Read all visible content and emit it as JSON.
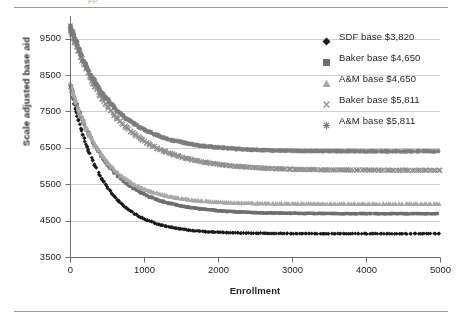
{
  "figure": {
    "clipped_caption": "pp",
    "background": "#ffffff"
  },
  "chart_data": {
    "type": "scatter",
    "title": "",
    "xlabel": "Enrollment",
    "ylabel": "Scale adjusted base aid",
    "xlim": [
      0,
      5000
    ],
    "ylim": [
      3500,
      9500
    ],
    "y_axis_overflow_top": 9900,
    "xticks": [
      0,
      1000,
      2000,
      3000,
      4000,
      5000
    ],
    "yticks": [
      3500,
      4500,
      5500,
      6500,
      7500,
      8500,
      9500
    ],
    "grid": "horizontal",
    "legend_position": "right",
    "series": [
      {
        "name": "SDF base $3,820",
        "marker": "diamond",
        "color": "#1a1a1a",
        "start_value": 8150,
        "asymptote": 4140,
        "decay_enrollment": 430,
        "flat_from_enrollment": 1700,
        "spread": 55
      },
      {
        "name": "Baker base $4,650",
        "marker": "square",
        "color": "#6e6e6e",
        "start_value": 8200,
        "asymptote": 4690,
        "decay_enrollment": 520,
        "flat_from_enrollment": 2600,
        "spread": 55
      },
      {
        "name": "A&M base $4,650",
        "marker": "triangle",
        "color": "#a8a8a8",
        "start_value": 8230,
        "asymptote": 4960,
        "decay_enrollment": 470,
        "flat_from_enrollment": 2300,
        "spread": 55
      },
      {
        "name": "Baker base $5,811",
        "marker": "cross",
        "color": "#8f8f8f",
        "start_value": 9780,
        "asymptote": 5880,
        "decay_enrollment": 620,
        "flat_from_enrollment": 3000,
        "spread": 70
      },
      {
        "name": "A&M base $5,811",
        "marker": "asterisk",
        "color": "#7c7c7c",
        "start_value": 9820,
        "asymptote": 6400,
        "decay_enrollment": 560,
        "flat_from_enrollment": 2800,
        "spread": 70
      }
    ],
    "axis_color": "#6d6d6d",
    "grid_color": "#cfcfcf",
    "tick_label_color": "#231f20",
    "tick_font_size": 9.5,
    "point_count_per_series": 260
  },
  "legend": {
    "items": [
      {
        "label": "SDF base $3,820",
        "marker": "diamond",
        "color": "#1a1a1a"
      },
      {
        "label": "Baker base $4,650",
        "marker": "square",
        "color": "#6e6e6e"
      },
      {
        "label": "A&M base $4,650",
        "marker": "triangle",
        "color": "#a8a8a8"
      },
      {
        "label": "Baker base $5,811",
        "marker": "cross",
        "color": "#8f8f8f"
      },
      {
        "label": "A&M base $5,811",
        "marker": "asterisk",
        "color": "#7c7c7c"
      }
    ]
  }
}
